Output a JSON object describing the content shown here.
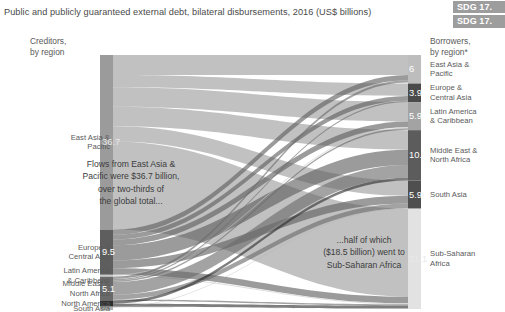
{
  "header": {
    "title": "Public and publicly guaranteed external debt, bilateral disbursements, 2016 (US$ billions)",
    "badges": [
      "SDG 17.",
      "SDG 17."
    ],
    "badge_color": "#9d9d9d"
  },
  "columns": {
    "left_header": "Creditors,\nby region",
    "right_header": "Borrowers,\nby region*"
  },
  "annotations": {
    "left": "Flows from East Asia &\nPacific were $36.7 billion,\nover two-thirds of\nthe global total...",
    "right": "...half of which\n($18.5 billion) went to\nSub-Saharan Africa"
  },
  "chart_data": {
    "type": "sankey",
    "title": "Public and publicly guaranteed external debt, bilateral disbursements, 2016 (US$ billions)",
    "units": "US$ billions",
    "year": 2016,
    "total": 53.6,
    "creditor_axis_label": "Creditors, by region",
    "borrower_axis_label": "Borrowers, by region*",
    "nodes_left": [
      {
        "name": "East Asia & Pacific",
        "value": 36.7,
        "label": "36.7",
        "color": "#9b9b9b",
        "show_value": true
      },
      {
        "name": "Europe & Central Asia",
        "value": 9.5,
        "label": "9.5",
        "color": "#5e5e5e",
        "show_value": true
      },
      {
        "name": "Latin America & Caribbean",
        "value": 0.4,
        "label": "",
        "color": "#c9c9c9",
        "show_value": false
      },
      {
        "name": "Middle East & North Africa",
        "value": 5.1,
        "label": "5.1",
        "color": "#6a6a6a",
        "show_value": true
      },
      {
        "name": "North America",
        "value": 1.2,
        "label": "",
        "color": "#2e2e2e",
        "show_value": false
      },
      {
        "name": "South Asia",
        "value": 0.7,
        "label": "",
        "color": "#b0b0b0",
        "show_value": false
      }
    ],
    "nodes_right": [
      {
        "name": "East Asia & Pacific",
        "value": 6.0,
        "label": "6",
        "color": "#bdbdbd",
        "show_value": true
      },
      {
        "name": "Europe & Central Asia",
        "value": 3.9,
        "label": "3.9",
        "color": "#4a4a4a",
        "show_value": true
      },
      {
        "name": "Latin America & Caribbean",
        "value": 5.9,
        "label": "5.9",
        "color": "#a3a3a3",
        "show_value": true
      },
      {
        "name": "Middle East & North Africa",
        "value": 10.6,
        "label": "10.6",
        "color": "#5c5c5c",
        "show_value": true
      },
      {
        "name": "South Asia",
        "value": 5.9,
        "label": "5.9",
        "color": "#4f4f4f",
        "show_value": true
      },
      {
        "name": "Sub-Saharan Africa",
        "value": 21.1,
        "label": "21.1",
        "color": "#e2e2e2",
        "show_value": true
      }
    ],
    "links": [
      {
        "source": "East Asia & Pacific",
        "target": "East Asia & Pacific",
        "value": 4.2
      },
      {
        "source": "East Asia & Pacific",
        "target": "Europe & Central Asia",
        "value": 2.6
      },
      {
        "source": "East Asia & Pacific",
        "target": "Latin America & Caribbean",
        "value": 4.1
      },
      {
        "source": "East Asia & Pacific",
        "target": "Middle East & North Africa",
        "value": 4.1
      },
      {
        "source": "East Asia & Pacific",
        "target": "South Asia",
        "value": 3.2
      },
      {
        "source": "East Asia & Pacific",
        "target": "Sub-Saharan Africa",
        "value": 18.5
      },
      {
        "source": "Europe & Central Asia",
        "target": "East Asia & Pacific",
        "value": 1.1
      },
      {
        "source": "Europe & Central Asia",
        "target": "Europe & Central Asia",
        "value": 1.0
      },
      {
        "source": "Europe & Central Asia",
        "target": "Latin America & Caribbean",
        "value": 1.2
      },
      {
        "source": "Europe & Central Asia",
        "target": "Middle East & North Africa",
        "value": 3.2
      },
      {
        "source": "Europe & Central Asia",
        "target": "South Asia",
        "value": 1.6
      },
      {
        "source": "Europe & Central Asia",
        "target": "Sub-Saharan Africa",
        "value": 1.4
      },
      {
        "source": "Latin America & Caribbean",
        "target": "Latin America & Caribbean",
        "value": 0.2
      },
      {
        "source": "Latin America & Caribbean",
        "target": "Sub-Saharan Africa",
        "value": 0.2
      },
      {
        "source": "Middle East & North Africa",
        "target": "East Asia & Pacific",
        "value": 0.5
      },
      {
        "source": "Middle East & North Africa",
        "target": "Europe & Central Asia",
        "value": 0.3
      },
      {
        "source": "Middle East & North Africa",
        "target": "Latin America & Caribbean",
        "value": 0.3
      },
      {
        "source": "Middle East & North Africa",
        "target": "Middle East & North Africa",
        "value": 2.7
      },
      {
        "source": "Middle East & North Africa",
        "target": "South Asia",
        "value": 1.0
      },
      {
        "source": "Middle East & North Africa",
        "target": "Sub-Saharan Africa",
        "value": 0.3
      },
      {
        "source": "North America",
        "target": "Middle East & North Africa",
        "value": 0.6
      },
      {
        "source": "North America",
        "target": "Sub-Saharan Africa",
        "value": 0.6
      },
      {
        "source": "South Asia",
        "target": "South Asia",
        "value": 0.1
      },
      {
        "source": "South Asia",
        "target": "Sub-Saharan Africa",
        "value": 0.1
      }
    ],
    "left_labels": [
      "East Asia &\nPacific",
      "Europe &\nCentral Asia",
      "Latin America\n& Caribbean",
      "Middle East &\nNorth Africa",
      "North America",
      "South Asia"
    ],
    "right_labels": [
      "East Asia &\nPacific",
      "Europe &\nCentral Asia",
      "Latin America\n& Caribbean",
      "Middle East &\nNorth Africa",
      "South Asia",
      "Sub-Saharan\nAfrica"
    ]
  }
}
